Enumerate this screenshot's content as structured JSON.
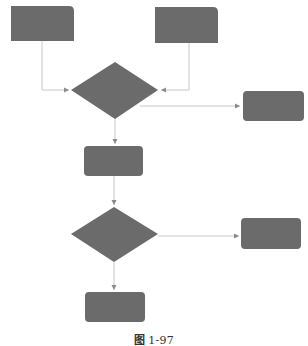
{
  "colors": {
    "shape_fill": "#6b6b6b",
    "connector": "#c8c8c8",
    "arrowhead": "#8a8a8a",
    "background": "#ffffff"
  },
  "diagram": {
    "type": "flowchart",
    "nodes": [
      {
        "id": "input-a",
        "shape": "rect-corner-tr",
        "x": 11,
        "y": 6,
        "w": 63,
        "h": 35,
        "label": ""
      },
      {
        "id": "input-b",
        "shape": "rect-corner-tr",
        "x": 155,
        "y": 7,
        "w": 63,
        "h": 36,
        "label": ""
      },
      {
        "id": "decision-1",
        "shape": "diamond",
        "cx": 115,
        "cy": 90,
        "w": 87,
        "h": 57,
        "label": ""
      },
      {
        "id": "branch-1",
        "shape": "rounded-rect",
        "x": 243,
        "y": 91,
        "w": 61,
        "h": 30,
        "label": ""
      },
      {
        "id": "process-1",
        "shape": "rounded-rect",
        "x": 84,
        "y": 146,
        "w": 59,
        "h": 30,
        "label": ""
      },
      {
        "id": "decision-2",
        "shape": "diamond",
        "cx": 114,
        "cy": 234,
        "w": 87,
        "h": 55,
        "label": ""
      },
      {
        "id": "branch-2",
        "shape": "rounded-rect",
        "x": 241,
        "y": 218,
        "w": 60,
        "h": 31,
        "label": ""
      },
      {
        "id": "process-2",
        "shape": "rounded-rect",
        "x": 85,
        "y": 292,
        "w": 60,
        "h": 30,
        "label": ""
      }
    ],
    "edges": [
      {
        "from": "input-a",
        "to": "decision-1"
      },
      {
        "from": "input-b",
        "to": "decision-1"
      },
      {
        "from": "decision-1",
        "to": "branch-1"
      },
      {
        "from": "decision-1",
        "to": "process-1"
      },
      {
        "from": "process-1",
        "to": "decision-2"
      },
      {
        "from": "decision-2",
        "to": "branch-2"
      },
      {
        "from": "decision-2",
        "to": "process-2"
      }
    ]
  },
  "caption": {
    "prefix": "图",
    "number": "1-97"
  }
}
